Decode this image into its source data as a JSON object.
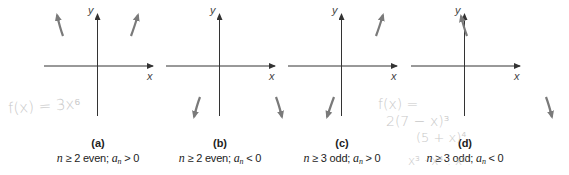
{
  "figure": {
    "colors": {
      "axis": "#333333",
      "arrow": "#7a7a7a",
      "text": "#222222",
      "handwriting": "#c8c8c8"
    },
    "axis_labels": {
      "x": "x",
      "y": "y"
    },
    "panels": [
      {
        "id": "a",
        "label": "(a)",
        "caption_parts": {
          "n": "n",
          "rel_n": " ≥ 2 even; ",
          "a": "a",
          "sub": "n",
          "rel_a": " > 0"
        },
        "caption": "n ≥ 2 even; a_n > 0",
        "end_behavior": {
          "left": "up",
          "right": "up"
        }
      },
      {
        "id": "b",
        "label": "(b)",
        "caption_parts": {
          "n": "n",
          "rel_n": " ≥ 2 even; ",
          "a": "a",
          "sub": "n",
          "rel_a": " < 0"
        },
        "caption": "n ≥ 2 even; a_n < 0",
        "end_behavior": {
          "left": "down",
          "right": "down"
        }
      },
      {
        "id": "c",
        "label": "(c)",
        "caption_parts": {
          "n": "n",
          "rel_n": " ≥ 3 odd; ",
          "a": "a",
          "sub": "n",
          "rel_a": " > 0"
        },
        "caption": "n ≥ 3 odd; a_n > 0",
        "end_behavior": {
          "left": "down",
          "right": "up"
        }
      },
      {
        "id": "d",
        "label": "(d)",
        "caption_parts": {
          "n": "n",
          "rel_n": " ≥ 3 odd; ",
          "a": "a",
          "sub": "n",
          "rel_a": " < 0"
        },
        "caption": "n ≥ 3 odd; a_n < 0",
        "end_behavior": {
          "left": "up",
          "right": "down"
        }
      }
    ],
    "handwritten_notes": [
      {
        "id": "note-a",
        "text": "f(x) = 3x⁶"
      },
      {
        "id": "note-c-line1",
        "text": "f(x) ="
      },
      {
        "id": "note-c-line2",
        "text": "2(7 − x)³"
      },
      {
        "id": "note-c-line3",
        "text": "(5 + x)⁴"
      },
      {
        "id": "note-c-line4",
        "text": "x³ · x⁴ : x⁷"
      }
    ]
  }
}
